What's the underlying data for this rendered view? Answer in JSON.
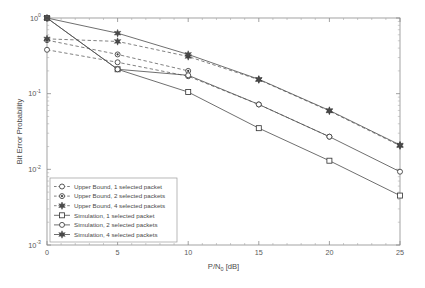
{
  "chart_data": {
    "type": "line",
    "title": "",
    "xlabel": "P/N_0 [dB]",
    "xlabel_main": "P/N",
    "xlabel_sub": "0",
    "xlabel_unit": " [dB]",
    "ylabel": "Bit Error Probability",
    "xlim": [
      0,
      25
    ],
    "ylim": [
      0.001,
      1
    ],
    "yscale": "log",
    "xticks": [
      0,
      5,
      10,
      15,
      20,
      25
    ],
    "xtick_labels": [
      "0",
      "5",
      "10",
      "15",
      "20",
      "25"
    ],
    "yticks": [
      1,
      0.1,
      0.01,
      0.001
    ],
    "ytick_labels": [
      "10^0",
      "10^-1",
      "10^-2",
      "10^-3"
    ],
    "ytick_mantissa": [
      "10",
      "10",
      "10",
      "10"
    ],
    "ytick_exponent": [
      "0",
      "-1",
      "-2",
      "-3"
    ],
    "grid": false,
    "legend_position": "lower-left",
    "x": [
      0,
      5,
      10,
      15,
      20,
      25
    ],
    "series": [
      {
        "name": "Upper Bound, 1 selected packet",
        "marker": "circle-open",
        "linestyle": "dashed",
        "x": [
          0,
          5,
          10,
          15,
          20
        ],
        "values": [
          0.38,
          0.26,
          0.17,
          0.072,
          0.027
        ]
      },
      {
        "name": "Upper Bound, 2 selected packets",
        "marker": "circle-dot",
        "linestyle": "dashed",
        "x": [
          0,
          5,
          10
        ],
        "values": [
          0.51,
          0.33,
          0.2
        ]
      },
      {
        "name": "Upper Bound, 4 selected packets",
        "marker": "star-filled",
        "linestyle": "dashed",
        "x": [
          0,
          5,
          10,
          15,
          20,
          25
        ],
        "values": [
          0.53,
          0.49,
          0.31,
          0.153,
          0.059,
          0.0205
        ]
      },
      {
        "name": "Simulation, 1 selected packet",
        "marker": "square-open",
        "linestyle": "solid",
        "x": [
          0,
          5,
          10,
          15,
          20,
          25
        ],
        "values": [
          1.0,
          0.21,
          0.105,
          0.035,
          0.013,
          0.0045
        ]
      },
      {
        "name": "Simulation, 2 selected packets",
        "marker": "circle-open",
        "linestyle": "solid",
        "x": [
          0,
          5,
          10,
          15,
          20,
          25
        ],
        "values": [
          1.0,
          0.21,
          0.175,
          0.072,
          0.027,
          0.0093
        ]
      },
      {
        "name": "Simulation, 4 selected packets",
        "marker": "star-filled",
        "linestyle": "solid",
        "x": [
          0,
          5,
          10,
          15,
          20,
          25
        ],
        "values": [
          1.0,
          0.63,
          0.33,
          0.155,
          0.06,
          0.021
        ]
      }
    ]
  },
  "legend": {
    "entries": [
      {
        "label": "Upper Bound, 1 selected packet"
      },
      {
        "label": "Upper Bound, 2 selected packets"
      },
      {
        "label": "Upper Bound, 4 selected packets"
      },
      {
        "label": "Simulation, 1 selected packet"
      },
      {
        "label": "Simulation, 2 selected packets"
      },
      {
        "label": "Simulation, 4 selected packets"
      }
    ]
  },
  "colors": {
    "axis": "#8c8c8c",
    "line": "#555555",
    "dashed_line": "#6a6a6a",
    "marker_stroke": "#3a3a3a",
    "marker_fill": "#4a4a4a",
    "text": "#4a4a4a",
    "background": "#ffffff"
  }
}
